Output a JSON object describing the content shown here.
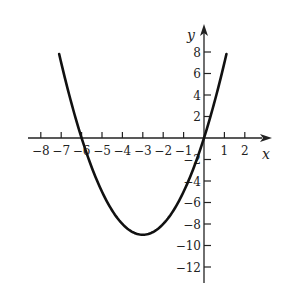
{
  "chart_data": {
    "type": "line",
    "title": "",
    "function": "y = x^2 + 6x",
    "xlabel": "x",
    "ylabel": "y",
    "xlim": [
      -8.5,
      3
    ],
    "ylim": [
      -13.5,
      10
    ],
    "x_ticks": [
      -8,
      -7,
      -6,
      -5,
      -4,
      -3,
      -2,
      -1,
      1,
      2
    ],
    "x_tick_labels": [
      "−8",
      "−7",
      "−6",
      "−5",
      "−4",
      "−3",
      "−2",
      "−1",
      "1",
      "2"
    ],
    "y_ticks": [
      8,
      6,
      4,
      2,
      -2,
      -4,
      -6,
      -8,
      -10,
      -12
    ],
    "y_tick_labels": [
      "8",
      "6",
      "4",
      "2",
      "−2",
      "−4",
      "−6",
      "−8",
      "−10",
      "−12"
    ],
    "grid": false,
    "legend": null,
    "series": [
      {
        "name": "parabola",
        "color": "#111111",
        "x": [
          -7.1,
          -7,
          -6.5,
          -6,
          -5.5,
          -5,
          -4.5,
          -4,
          -3.5,
          -3,
          -2.5,
          -2,
          -1.5,
          -1,
          -0.5,
          0,
          0.5,
          1,
          1.1
        ],
        "y": [
          7.81,
          7,
          3.25,
          0,
          -2.75,
          -5,
          -6.75,
          -8,
          -8.75,
          -9,
          -8.75,
          -8,
          -6.75,
          -5,
          -2.75,
          0,
          3.25,
          7,
          7.81
        ]
      }
    ],
    "annotations": {
      "vertex": [
        -3,
        -9
      ],
      "x_intercepts": [
        -6,
        0
      ]
    }
  },
  "colors": {
    "axis": "#222222",
    "curve": "#111111",
    "background": "#ffffff"
  }
}
